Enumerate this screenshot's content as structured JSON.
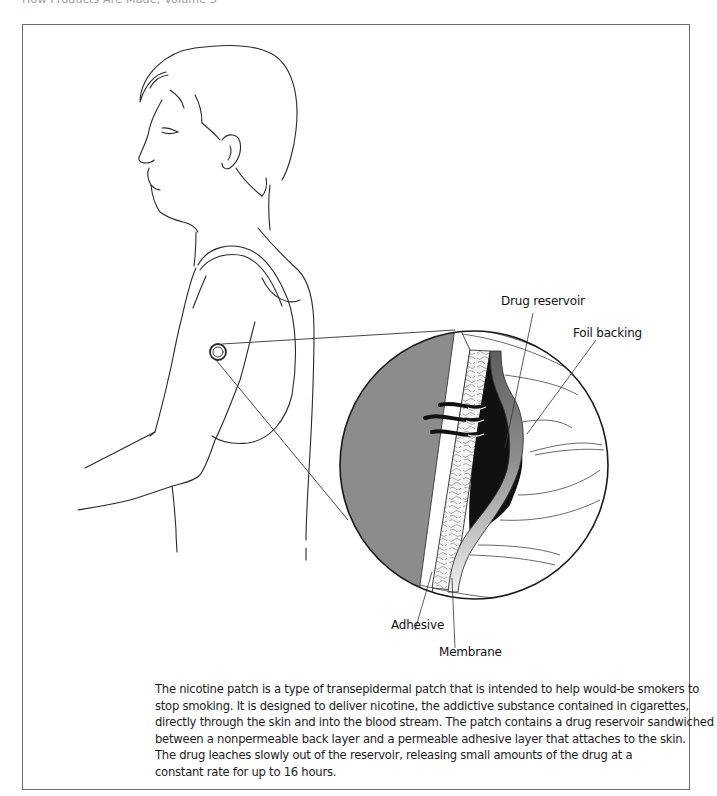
{
  "header": {
    "running_head": "How Products Are Made, Volume 5"
  },
  "figure": {
    "icons": [
      "person-profile-illustration",
      "patch-marker-icon",
      "magnifier-circle-icon"
    ],
    "colors": {
      "skin_gray": "#8c8c8c",
      "drug_black": "#111111",
      "foil_dark": "#6a6a6a",
      "foil_light": "#e6e6e6",
      "outline": "#2a2a2a",
      "frame": "#6e6e6e"
    },
    "labels": {
      "drug_reservoir": "Drug reservoir",
      "foil_backing": "Foil backing",
      "adhesive": "Adhesive",
      "membrane": "Membrane"
    }
  },
  "caption": {
    "lines": [
      "The nicotine patch is a type of transepidermal patch that is intended to help would-be smokers to",
      "stop smoking. It is designed to deliver nicotine, the addictive substance contained in cigarettes,",
      "directly through the skin and into the blood stream. The patch contains a drug reservoir sandwiched",
      "between a nonpermeable back layer and a permeable adhesive layer that attaches to the skin.",
      "The drug leaches slowly out of the reservoir, releasing small amounts of the drug at a",
      "constant rate for up to 16 hours."
    ]
  }
}
